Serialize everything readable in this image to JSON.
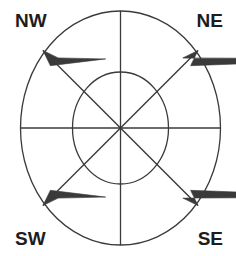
{
  "figure": {
    "type": "compass-rose-diagram",
    "background_color": "#ffffff",
    "stroke_color": "#3a3a3a",
    "label_color": "#1d1d1d"
  },
  "labels": {
    "nw": "NW",
    "ne": "NE",
    "sw": "SW",
    "se": "SE"
  },
  "chart_data": {
    "type": "scatter",
    "title": "",
    "subtitle": "",
    "xlabel": "",
    "ylabel": "",
    "grid": false,
    "legend_position": "none",
    "center": {
      "x": 120.5,
      "y": 128
    },
    "rings": [
      {
        "name": "outer-ellipse",
        "rx": 100,
        "ry": 117
      },
      {
        "name": "inner-ellipse",
        "rx": 48,
        "ry": 56
      }
    ],
    "axes": [
      {
        "name": "vertical-axis",
        "x1": 120.5,
        "y1": 11,
        "x2": 120.5,
        "y2": 245
      },
      {
        "name": "horizontal-axis",
        "x1": 20.5,
        "y1": 128,
        "x2": 220.5,
        "y2": 128
      }
    ],
    "diagonals": [
      {
        "name": "nw-diagonal",
        "direction": "NW",
        "angle_deg": 135,
        "arrowhead": true
      },
      {
        "name": "ne-diagonal",
        "direction": "NE",
        "angle_deg": 45,
        "arrowhead": true
      },
      {
        "name": "sw-diagonal",
        "direction": "SW",
        "angle_deg": 225,
        "arrowhead": true
      },
      {
        "name": "se-diagonal",
        "direction": "SE",
        "angle_deg": 315,
        "arrowhead": true
      }
    ],
    "annotations": [
      "NW",
      "NE",
      "SW",
      "SE"
    ]
  }
}
